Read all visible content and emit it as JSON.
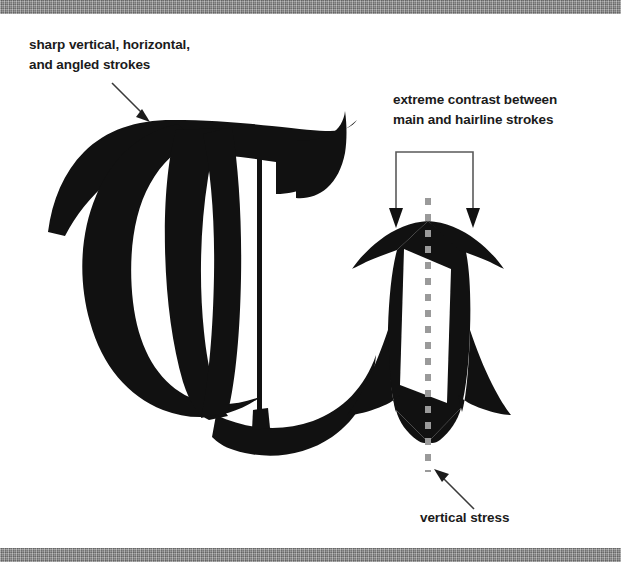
{
  "figure": {
    "background_color": "#ffffff",
    "band_color": "#858585",
    "ink_color": "#111111",
    "stress_line_color": "#9a9a9a",
    "annotation_color": "#3a3a3a"
  },
  "captions": {
    "sharp_strokes": "sharp vertical, horizontal,\nand angled strokes",
    "extreme_contrast": "extreme contrast between\nmain and hairline strokes",
    "vertical_stress": "vertical stress"
  },
  "glyphs": {
    "capital": "T",
    "lowercase": "o",
    "style": "blackletter"
  },
  "annotations": {
    "arrow_sharp_strokes": "arrow pointing down-right to capital T",
    "bracket_contrast": "bracket with two down arrows over the o",
    "arrow_vertical_stress": "arrow pointing up-left to the dashed stress axis",
    "stress_axis": "vertical dashed line through the o"
  }
}
